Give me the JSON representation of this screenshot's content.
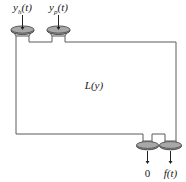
{
  "figure": {
    "type": "block-schematic-diagram",
    "center_label": {
      "base": "L",
      "open_paren": "(",
      "arg": "y",
      "close_paren": ")",
      "full": "L(y)"
    },
    "inputs": [
      {
        "id": "input-left",
        "base": "y",
        "subscript": "h",
        "arg": "(t)",
        "full": "y_h(t)",
        "arrow_direction": "down"
      },
      {
        "id": "input-right",
        "base": "y",
        "subscript": "p",
        "arg": "(t)",
        "full": "y_p(t)",
        "arrow_direction": "down"
      }
    ],
    "outputs": [
      {
        "id": "output-left",
        "base": "0",
        "subscript": "",
        "arg": "",
        "full": "0",
        "arrow_direction": "down"
      },
      {
        "id": "output-right",
        "base": "f",
        "subscript": "",
        "arg": "(t)",
        "full": "f(t)",
        "arrow_direction": "down"
      }
    ],
    "colors": {
      "outline": "#5a5a5a",
      "funnel_fill": "#9a9a9a",
      "funnel_stroke": "#4a4a4a",
      "arrow": "#222222",
      "text": "#1a1a1a",
      "background": "#ffffff"
    }
  }
}
